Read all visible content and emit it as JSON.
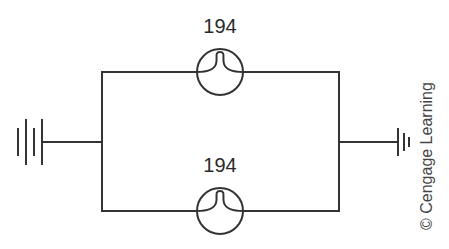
{
  "diagram": {
    "type": "parallel-lamp-circuit",
    "lamps": [
      {
        "id": "top",
        "label": "194"
      },
      {
        "id": "bottom",
        "label": "194"
      }
    ],
    "left_source": "battery-symbol",
    "right_source": "ground-symbol",
    "credit": "© Cengage Learning",
    "colors": {
      "line": "#333333",
      "background": "#ffffff"
    }
  }
}
